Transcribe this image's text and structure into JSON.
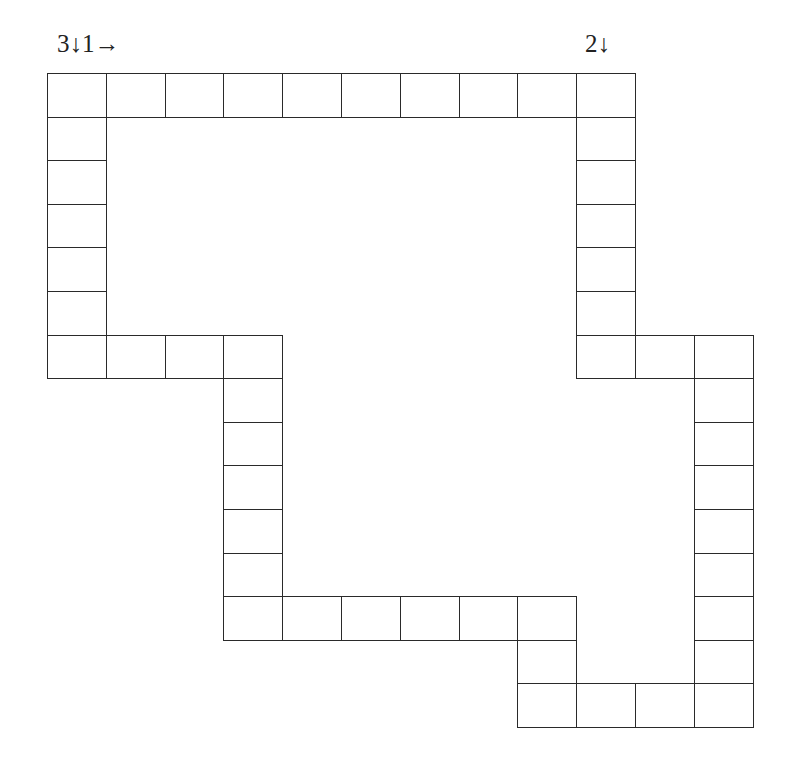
{
  "labels": [
    {
      "text": "3↓1→",
      "x": 57,
      "y": 45,
      "name": "clue-label-3-down-1-across"
    },
    {
      "text": "2↓",
      "x": 585,
      "y": 45,
      "name": "clue-label-2-down"
    }
  ],
  "grid": {
    "origin_x": 47,
    "origin_y": 73,
    "cell_w": 58.8,
    "cell_h": 43.6,
    "cells": [
      [
        0,
        0
      ],
      [
        0,
        1
      ],
      [
        0,
        2
      ],
      [
        0,
        3
      ],
      [
        0,
        4
      ],
      [
        0,
        5
      ],
      [
        0,
        6
      ],
      [
        0,
        7
      ],
      [
        0,
        8
      ],
      [
        0,
        9
      ],
      [
        1,
        0
      ],
      [
        1,
        9
      ],
      [
        2,
        0
      ],
      [
        2,
        9
      ],
      [
        3,
        0
      ],
      [
        3,
        9
      ],
      [
        4,
        0
      ],
      [
        4,
        9
      ],
      [
        5,
        0
      ],
      [
        5,
        9
      ],
      [
        6,
        0
      ],
      [
        6,
        1
      ],
      [
        6,
        2
      ],
      [
        6,
        3
      ],
      [
        6,
        9
      ],
      [
        6,
        10
      ],
      [
        6,
        11
      ],
      [
        7,
        3
      ],
      [
        7,
        11
      ],
      [
        8,
        3
      ],
      [
        8,
        11
      ],
      [
        9,
        3
      ],
      [
        9,
        11
      ],
      [
        10,
        3
      ],
      [
        10,
        11
      ],
      [
        11,
        3
      ],
      [
        11,
        11
      ],
      [
        12,
        3
      ],
      [
        12,
        4
      ],
      [
        12,
        5
      ],
      [
        12,
        6
      ],
      [
        12,
        7
      ],
      [
        12,
        8
      ],
      [
        12,
        11
      ],
      [
        13,
        8
      ],
      [
        13,
        11
      ],
      [
        14,
        8
      ],
      [
        14,
        9
      ],
      [
        14,
        10
      ],
      [
        14,
        11
      ]
    ]
  },
  "clues": {
    "across": [
      {
        "number": "1",
        "direction": "→"
      }
    ],
    "down": [
      {
        "number": "2",
        "direction": "↓"
      },
      {
        "number": "3",
        "direction": "↓"
      }
    ]
  }
}
